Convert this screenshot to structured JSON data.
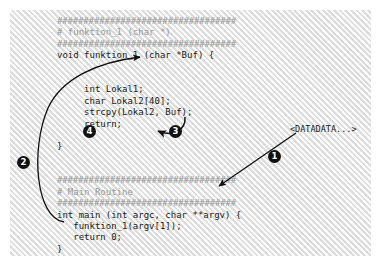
{
  "figure": {
    "panel_color": "#eeeeee",
    "code_color": "#1b1b1b",
    "comment_color": "#9a9a9a",
    "marker_color": "#111111"
  },
  "code": {
    "lines": [
      {
        "kind": "hashes",
        "text": "##################################"
      },
      {
        "kind": "comment",
        "text": "# funktion_1 (char *)"
      },
      {
        "kind": "hashes",
        "text": "##################################"
      },
      {
        "kind": "code",
        "text": "void funktion_1 (char *Buf) {"
      },
      {
        "kind": "blank",
        "text": " "
      },
      {
        "kind": "blank",
        "text": " "
      },
      {
        "kind": "code",
        "text": "     int Lokal1;"
      },
      {
        "kind": "code",
        "text": "     char Lokal2[40];"
      },
      {
        "kind": "code",
        "text": "     strcpy(Lokal2, Buf);"
      },
      {
        "kind": "code",
        "text": "     return;"
      },
      {
        "kind": "blank",
        "text": " "
      },
      {
        "kind": "code",
        "text": "}"
      },
      {
        "kind": "blank",
        "text": " "
      },
      {
        "kind": "blank",
        "text": " "
      },
      {
        "kind": "hashes",
        "text": "##################################"
      },
      {
        "kind": "comment",
        "text": "# Main Routine"
      },
      {
        "kind": "hashes",
        "text": "##################################"
      },
      {
        "kind": "code",
        "text": "int main (int argc, char **argv) {"
      },
      {
        "kind": "code",
        "text": "   funktion_1(argv[1]);"
      },
      {
        "kind": "code",
        "text": "   return 0;"
      },
      {
        "kind": "code",
        "text": "}"
      }
    ]
  },
  "labels": {
    "datadata": "<DATADATA...>"
  },
  "markers": {
    "one": "1",
    "two": "2",
    "three": "3",
    "four": "4"
  }
}
